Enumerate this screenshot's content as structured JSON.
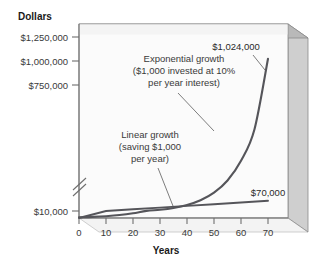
{
  "chart_data": {
    "type": "line",
    "title": "",
    "xlabel": "Years",
    "ylabel": "Dollars",
    "xlim": [
      0,
      73
    ],
    "ylim": [
      0,
      1320000
    ],
    "grid": false,
    "legend_position": "none",
    "axis_break": true,
    "axis_break_note": "y-axis broken between $10,000 and $750,000",
    "x_ticks": [
      "0",
      "10",
      "20",
      "30",
      "40",
      "50",
      "60",
      "70"
    ],
    "x_tick_values": [
      0,
      10,
      20,
      30,
      40,
      50,
      60,
      70
    ],
    "y_ticks": [
      "$10,000",
      "$750,000",
      "$1,000,000",
      "$1,250,000"
    ],
    "y_tick_values": [
      10000,
      750000,
      1000000,
      1250000
    ],
    "series": [
      {
        "name": "Exponential growth",
        "annotation": "Exponential growth\n($1,000 invested at 10%\nper year interest)",
        "annotation_lines": [
          "Exponential growth",
          "($1,000 invested at 10%",
          "per year interest)"
        ],
        "end_label": "$1,024,000",
        "x": [
          0,
          5,
          10,
          15,
          20,
          25,
          30,
          35,
          40,
          45,
          50,
          55,
          60,
          65,
          70
        ],
        "values": [
          1000,
          1611,
          2594,
          4177,
          6727,
          10835,
          17449,
          28102,
          45259,
          72890,
          117391,
          189059,
          304482,
          490371,
          1024000
        ]
      },
      {
        "name": "Linear growth",
        "annotation": "Linear growth\n(saving $1,000\nper year)",
        "annotation_lines": [
          "Linear growth",
          "(saving $1,000",
          "per year)"
        ],
        "end_label": "$70,000",
        "x": [
          0,
          10,
          20,
          30,
          40,
          50,
          60,
          70
        ],
        "values": [
          0,
          10000,
          20000,
          30000,
          40000,
          50000,
          60000,
          70000
        ]
      }
    ]
  },
  "labels": {
    "y_axis_title": "Dollars",
    "x_axis_title": "Years",
    "ytick_0": "$10,000",
    "ytick_1": "$750,000",
    "ytick_2": "$1,000,000",
    "ytick_3": "$1,250,000",
    "xtick_0": "0",
    "xtick_1": "10",
    "xtick_2": "20",
    "xtick_3": "30",
    "xtick_4": "40",
    "xtick_5": "50",
    "xtick_6": "60",
    "xtick_7": "70",
    "exp_annot_line1": "Exponential growth",
    "exp_annot_line2": "($1,000 invested at 10%",
    "exp_annot_line3": "per year interest)",
    "lin_annot_line1": "Linear growth",
    "lin_annot_line2": "(saving $1,000",
    "lin_annot_line3": "per year)",
    "exp_end_label": "$1,024,000",
    "lin_end_label": "$70,000"
  },
  "colors": {
    "background": "#ffffff",
    "plot_face": "#fbfbfb",
    "panel_side": "#cfcfcf",
    "panel_top": "#b5b5b5",
    "panel_edge": "#8a8a8a",
    "curve": "#55555a",
    "axis": "#6e6e6e",
    "text": "#333333",
    "leader": "#6e6e6e"
  }
}
